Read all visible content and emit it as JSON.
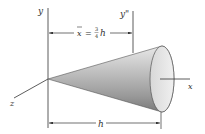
{
  "figure": {
    "axes": {
      "y_label": "y",
      "y2_label": "y\"",
      "x_label": "x",
      "z_label": "z"
    },
    "dimensions": {
      "centroid_label_lhs": "x",
      "centroid_label_eq": "=",
      "centroid_frac_num": "3",
      "centroid_frac_den": "4",
      "centroid_label_var": "h",
      "length_label": "h"
    },
    "colors": {
      "line": "#333333",
      "cone_light": "#e6e6e6",
      "cone_mid": "#b5b5b5",
      "cone_dark": "#7d7d7d",
      "base_face": "#e9e9e9"
    }
  }
}
